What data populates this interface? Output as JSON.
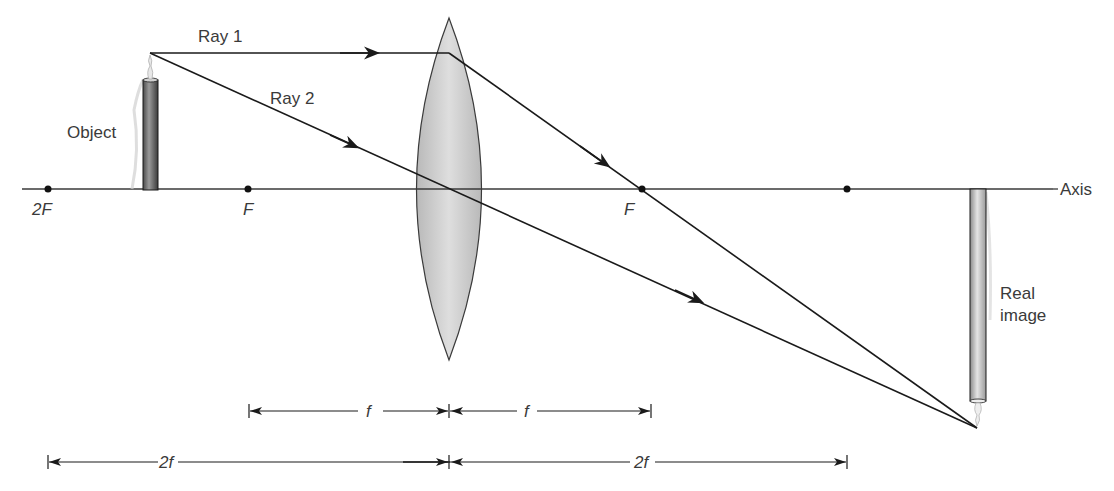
{
  "diagram": {
    "type": "converging-lens-ray-diagram",
    "labels": {
      "ray1": "Ray 1",
      "ray2": "Ray 2",
      "object": "Object",
      "axis": "Axis",
      "real_image_line1": "Real",
      "real_image_line2": "image",
      "focal_left": "F",
      "focal_right": "F",
      "two_f_left": "2F"
    },
    "dimensions": {
      "f_left": "f",
      "f_right": "f",
      "two_f_left": "2f",
      "two_f_right": "2f"
    },
    "colors": {
      "line": "#1a1a1a",
      "lens_fill": "#c8c8c8",
      "object_fill": "#6e6e6e",
      "image_fill": "#bdbdbd",
      "text": "#3a3a3a"
    }
  }
}
